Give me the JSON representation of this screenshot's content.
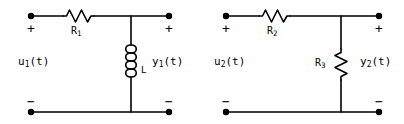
{
  "figure": {
    "background_color": "#ffffff",
    "stroke_color": "#000000",
    "width": 404,
    "height": 124
  },
  "circuits": [
    {
      "id": "circuit-left",
      "input_label": "u",
      "input_sub": "1",
      "input_arg": "(t)",
      "output_label": "y",
      "output_sub": "1",
      "output_arg": "(t)",
      "series_label": "R",
      "series_sub": "1",
      "series_type": "resistor",
      "shunt_label": "L",
      "shunt_sub": "",
      "shunt_type": "inductor",
      "terminal_in_top_sign": "+",
      "terminal_in_bottom_sign": "−",
      "terminal_out_top_sign": "+",
      "terminal_out_bottom_sign": "−"
    },
    {
      "id": "circuit-right",
      "input_label": "u",
      "input_sub": "2",
      "input_arg": "(t)",
      "output_label": "y",
      "output_sub": "2",
      "output_arg": "(t)",
      "series_label": "R",
      "series_sub": "2",
      "series_type": "resistor",
      "shunt_label": "R",
      "shunt_sub": "3",
      "shunt_type": "resistor",
      "terminal_in_top_sign": "+",
      "terminal_in_bottom_sign": "−",
      "terminal_out_top_sign": "+",
      "terminal_out_bottom_sign": "−"
    }
  ],
  "icons": {
    "terminal_node": "terminal-dot-icon",
    "resistor_symbol": "resistor-zigzag-icon",
    "inductor_symbol": "inductor-coil-icon"
  }
}
